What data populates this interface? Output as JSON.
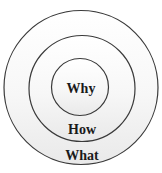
{
  "diagram": {
    "type": "concentric-circles",
    "layers": [
      {
        "id": "inner",
        "label": "Why",
        "cx": 80,
        "cy": 87,
        "r": 28.5
      },
      {
        "id": "middle",
        "label": "How",
        "cx": 82,
        "cy": 88.5,
        "r": 53
      },
      {
        "id": "outer",
        "label": "What",
        "cx": 81,
        "cy": 87.5,
        "r": 77
      }
    ],
    "colors": {
      "stroke": "#3a3a3a",
      "text": "#1a1a1a",
      "fill_top": "#ffffff",
      "fill_bottom": "#ececec"
    }
  }
}
